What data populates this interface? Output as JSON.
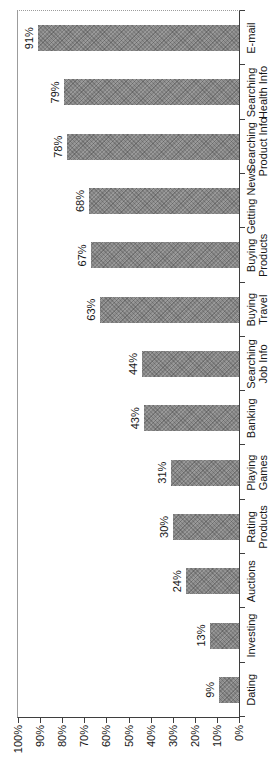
{
  "chart_data": {
    "type": "bar",
    "title": "",
    "xlabel": "",
    "ylabel": "",
    "orientation": "vertical-bars-page-rotated-90ccw",
    "categories": [
      "Dating",
      "Investing",
      "Auctions",
      "Rating Products",
      "Playing Games",
      "Banking",
      "Searching Job Info",
      "Buying Travel",
      "Buying Products",
      "Getting News",
      "Searching Product Info",
      "Searching Health Info",
      "E-mail"
    ],
    "category_lines": [
      [
        "Dating"
      ],
      [
        "Investing"
      ],
      [
        "Auctions"
      ],
      [
        "Rating",
        "Products"
      ],
      [
        "Playing",
        "Games"
      ],
      [
        "Banking"
      ],
      [
        "Searching",
        "Job Info"
      ],
      [
        "Buying",
        "Travel"
      ],
      [
        "Buying",
        "Products"
      ],
      [
        "Getting News"
      ],
      [
        "Searching",
        "Product Info"
      ],
      [
        "Searching",
        "Health Info"
      ],
      [
        "E-mail"
      ]
    ],
    "values": [
      9,
      13,
      24,
      30,
      31,
      43,
      44,
      63,
      67,
      68,
      78,
      79,
      91
    ],
    "value_labels": [
      "9%",
      "13%",
      "24%",
      "30%",
      "31%",
      "43%",
      "44%",
      "63%",
      "67%",
      "68%",
      "78%",
      "79%",
      "91%"
    ],
    "y_ticks": [
      "0%",
      "10%",
      "20%",
      "30%",
      "40%",
      "50%",
      "60%",
      "70%",
      "80%",
      "90%",
      "100%"
    ],
    "ylim": [
      0,
      100
    ],
    "grid": false,
    "legend": null,
    "colors": {
      "bar_fill": "#8f8f8f",
      "bar_hatch": "#6f6f6f",
      "axis_line": "#3f3f3f",
      "plot_border": "#9c9c9c",
      "text": "#161616",
      "background": "#ffffff"
    }
  }
}
